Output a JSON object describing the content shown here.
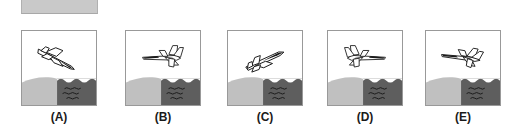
{
  "figure": {
    "type": "multiple-choice-image-options",
    "top_banner": {
      "name": "gray-banner",
      "color": "#c9c9c9"
    },
    "colors": {
      "land": "#c0c0c0",
      "water": "#5e5e5e",
      "sky": "#ffffff",
      "outline": "#1a1a1a",
      "panel_border": "#999999",
      "label_text": "#1a1a1a"
    },
    "scene": {
      "land_description": "rounded hill on left",
      "water_description": "dark sea on right with wavy lines",
      "wave_rows": 3
    },
    "options": [
      {
        "label": "(A)",
        "letter": "A",
        "aircraft": {
          "orientation": "nose-down to the right, diving",
          "rotation_deg": 22,
          "facing": "right",
          "view": "rear-three-quarter",
          "canopy_shaded": true
        }
      },
      {
        "label": "(B)",
        "letter": "B",
        "aircraft": {
          "orientation": "level flight to the left",
          "rotation_deg": 0,
          "facing": "left",
          "view": "side-three-quarter",
          "canopy_shaded": true
        }
      },
      {
        "label": "(C)",
        "letter": "C",
        "aircraft": {
          "orientation": "nose-up to the right, climbing",
          "rotation_deg": -20,
          "facing": "right",
          "view": "rear-three-quarter",
          "canopy_shaded": true
        }
      },
      {
        "label": "(D)",
        "letter": "D",
        "aircraft": {
          "orientation": "level flight to the right",
          "rotation_deg": 0,
          "facing": "right",
          "view": "side-three-quarter",
          "canopy_shaded": true
        }
      },
      {
        "label": "(E)",
        "letter": "E",
        "aircraft": {
          "orientation": "nose-down slightly to the left, shallow descent",
          "rotation_deg": 10,
          "facing": "left",
          "view": "side-three-quarter",
          "canopy_shaded": true
        }
      }
    ]
  }
}
